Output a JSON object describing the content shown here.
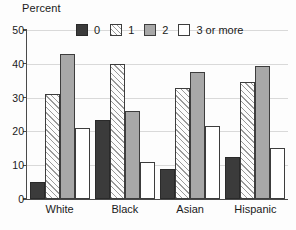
{
  "chart_data": {
    "type": "bar",
    "title": "",
    "subtitle": "",
    "xlabel": "",
    "ylabel": "Percent",
    "ylim": [
      0,
      50
    ],
    "ytick_labels": [
      "50",
      "40",
      "30",
      "20",
      "10",
      "0"
    ],
    "yticks": [
      50,
      40,
      30,
      20,
      10,
      0
    ],
    "grid": true,
    "legend_position": "top-center",
    "categories": [
      "White",
      "Black",
      "Asian",
      "Hispanic"
    ],
    "series": [
      {
        "name": "0",
        "values": [
          5,
          23.5,
          9,
          12.5
        ]
      },
      {
        "name": "1",
        "values": [
          31,
          40,
          33,
          34.5
        ]
      },
      {
        "name": "2",
        "values": [
          43,
          26,
          37.5,
          39.5
        ]
      },
      {
        "name": "3 or more",
        "values": [
          21,
          11,
          21.5,
          15
        ]
      }
    ]
  },
  "legend": {
    "items": [
      {
        "label": "0",
        "swatch": "dark-solid-swatch",
        "color": "#3b3b3b"
      },
      {
        "label": "1",
        "swatch": "diagonal-hatch-swatch",
        "color": "#ffffff"
      },
      {
        "label": "2",
        "swatch": "gray-solid-swatch",
        "color": "#a8a8a8"
      },
      {
        "label": "3 or more",
        "swatch": "white-solid-swatch",
        "color": "#ffffff"
      }
    ]
  },
  "axes": {
    "y_title": "Percent"
  },
  "colors": {
    "axis": "#4a4a4a",
    "grid": "#d9d9d9",
    "text": "#1a1a1a",
    "background": "#fdfdfd"
  }
}
